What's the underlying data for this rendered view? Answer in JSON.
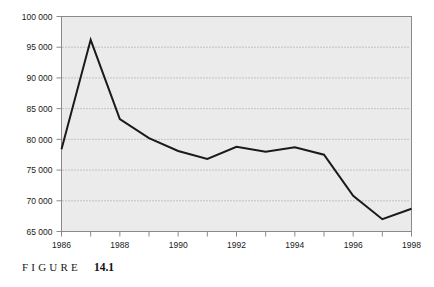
{
  "figure": {
    "caption_word": "FIGURE",
    "caption_number": "14.1"
  },
  "colors": {
    "plot_background": "#ebebeb",
    "plot_border": "#8a8a8a",
    "gridline": "#9a9a9a",
    "series_line": "#1a1a1a",
    "tick_label": "#1a1a1a",
    "page_background": "#ffffff"
  },
  "chart_data": {
    "type": "line",
    "title": "",
    "xlabel": "",
    "ylabel": "",
    "x": [
      1986,
      1987,
      1988,
      1989,
      1990,
      1991,
      1992,
      1993,
      1994,
      1995,
      1996,
      1997,
      1998
    ],
    "values": [
      78400,
      96200,
      83300,
      80200,
      78100,
      76800,
      78800,
      78000,
      78700,
      77500,
      70800,
      67000,
      68700
    ],
    "series": [
      {
        "name": "series-1",
        "values": [
          78400,
          96200,
          83300,
          80200,
          78100,
          76800,
          78800,
          78000,
          78700,
          77500,
          70800,
          67000,
          68700
        ]
      }
    ],
    "xlim": [
      1986,
      1998
    ],
    "ylim": [
      65000,
      100000
    ],
    "yticks": [
      65000,
      70000,
      75000,
      80000,
      85000,
      90000,
      95000,
      100000
    ],
    "ytick_labels": [
      "65 000",
      "70 000",
      "75 000",
      "80 000",
      "85 000",
      "90 000",
      "95 000",
      "100 000"
    ],
    "xticks": [
      1986,
      1987,
      1988,
      1989,
      1990,
      1991,
      1992,
      1993,
      1994,
      1995,
      1996,
      1997,
      1998
    ],
    "xtick_labels_shown": [
      {
        "x": 1986,
        "label": "1986"
      },
      {
        "x": 1988,
        "label": "1988"
      },
      {
        "x": 1990,
        "label": "1990"
      },
      {
        "x": 1992,
        "label": "1992"
      },
      {
        "x": 1994,
        "label": "1994"
      },
      {
        "x": 1996,
        "label": "1996"
      },
      {
        "x": 1998,
        "label": "1998"
      }
    ],
    "grid": true,
    "grid_axis": "y",
    "grid_style": "dotted",
    "legend": false,
    "legend_position": "none"
  }
}
